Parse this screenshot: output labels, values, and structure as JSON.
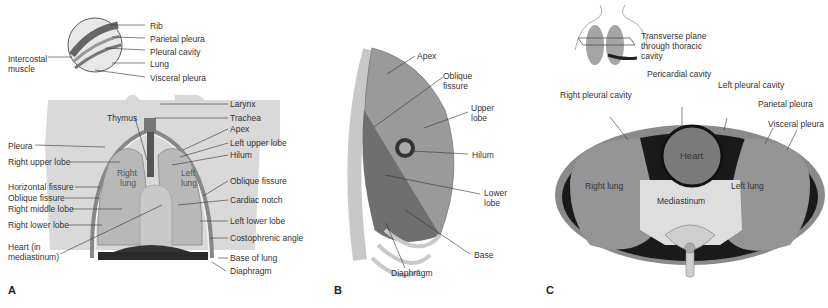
{
  "panels": {
    "A": {
      "letter": "A",
      "inset_labels": {
        "rib": "Rib",
        "parietal_pleura": "Parietal pleura",
        "pleural_cavity": "Pleural cavity",
        "lung": "Lung",
        "visceral_pleura": "Visceral pleura",
        "intercostal_muscle_1": "Intercostal",
        "intercostal_muscle_2": "muscle"
      },
      "left_labels": {
        "pleura": "Pleura",
        "right_upper_lobe": "Right upper lobe",
        "horizontal_fissure": "Horizontal fissure",
        "oblique_fissure": "Oblique fissure",
        "right_middle_lobe": "Right middle lobe",
        "right_lower_lobe": "Right lower lobe",
        "heart_1": "Heart (in",
        "heart_2": "mediastinum)"
      },
      "right_labels": {
        "larynx": "Larynx",
        "trachea": "Trachea",
        "apex": "Apex",
        "left_upper_lobe": "Left upper lobe",
        "hilum": "Hilum",
        "oblique_fissure": "Oblique fissure",
        "cardiac_notch": "Cardiac notch",
        "left_lower_lobe": "Left lower lobe",
        "costophrenic_angle": "Costophrenic angle",
        "base_of_lung": "Base of lung",
        "diaphragm": "Diaphragm"
      },
      "center_labels": {
        "thymus": "Thymus",
        "right_lung_1": "Right",
        "right_lung_2": "lung",
        "left_lung_1": "Left",
        "left_lung_2": "lung"
      }
    },
    "B": {
      "letter": "B",
      "labels": {
        "apex": "Apex",
        "oblique_fissure_1": "Oblique",
        "oblique_fissure_2": "fissure",
        "upper_lobe_1": "Upper",
        "upper_lobe_2": "lobe",
        "hilum": "Hilum",
        "lower_lobe_1": "Lower",
        "lower_lobe_2": "lobe",
        "base": "Base",
        "diaphragm": "Diaphragm"
      }
    },
    "C": {
      "letter": "C",
      "labels": {
        "transverse_1": "Transverse plane",
        "transverse_2": "through thoracic",
        "transverse_3": "cavity",
        "pericardial_cavity": "Pericardial cavity",
        "right_pleural_cavity": "Right pleural cavity",
        "left_pleural_cavity": "Left pleural cavity",
        "parietal_pleura": "Parietal pleura",
        "visceral_pleura": "Visceral pleura",
        "heart": "Heart",
        "right_lung": "Right lung",
        "left_lung": "Left lung",
        "mediastinum": "Mediastinum"
      }
    }
  },
  "colors": {
    "body_silhouette": "#d9d9d9",
    "lung": "#b5b5b5",
    "lung_dark": "#8a8a8a",
    "line": "#333333",
    "dark": "#1a1a1a",
    "light": "#e6e6e6"
  }
}
